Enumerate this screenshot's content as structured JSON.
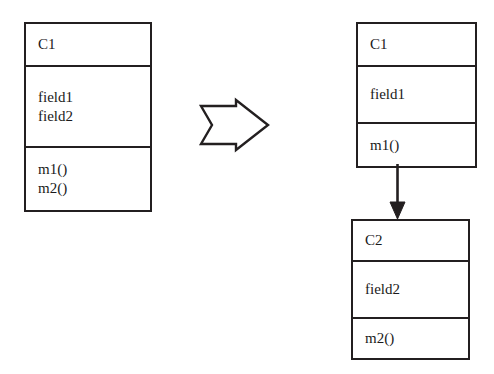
{
  "diagram": {
    "type": "uml-class-diagram",
    "background_color": "#ffffff",
    "stroke_color": "#231f20",
    "text_color": "#1a1a1a"
  },
  "before": {
    "class": {
      "name": "C1",
      "fields": [
        "field1",
        "field2"
      ],
      "operations": [
        "m1()",
        "m2()"
      ]
    }
  },
  "transform": {
    "icon": "block-arrow-right-icon",
    "direction": "right"
  },
  "after": {
    "classes": [
      {
        "name": "C1",
        "fields": [
          "field1"
        ],
        "operations": [
          "m1()"
        ]
      },
      {
        "name": "C2",
        "fields": [
          "field2"
        ],
        "operations": [
          "m2()"
        ]
      }
    ],
    "connector": {
      "icon": "arrow-down-icon",
      "style": "solid-line-filled-arrowhead",
      "from": "C1",
      "to": "C2"
    }
  }
}
